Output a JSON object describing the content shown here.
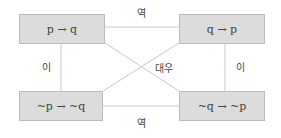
{
  "diagram": {
    "boxes": {
      "top_left": "p → q",
      "top_right": "q → p",
      "bottom_left": "~p → ~q",
      "bottom_right": "~q → ~p"
    },
    "labels": {
      "top": "역",
      "bottom": "역",
      "left": "이",
      "right": "이",
      "diagonal": "대우"
    },
    "colors": {
      "box_fill": "#dcdcdc",
      "box_border": "#bdbdbd",
      "line": "#c8c8c8"
    }
  }
}
